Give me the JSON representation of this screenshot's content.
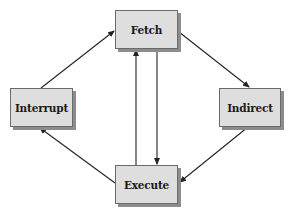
{
  "diagram": {
    "type": "state-cycle",
    "nodes": [
      {
        "id": "fetch",
        "label": "Fetch",
        "x": 115,
        "y": 10,
        "w": 63,
        "h": 39
      },
      {
        "id": "interrupt",
        "label": "Interrupt",
        "x": 10,
        "y": 88,
        "w": 63,
        "h": 39
      },
      {
        "id": "indirect",
        "label": "Indirect",
        "x": 219,
        "y": 88,
        "w": 62,
        "h": 39
      },
      {
        "id": "execute",
        "label": "Execute",
        "x": 115,
        "y": 165,
        "w": 63,
        "h": 39
      }
    ],
    "edges": [
      {
        "from": "interrupt",
        "to": "fetch",
        "x1": 41,
        "y1": 88,
        "x2": 114,
        "y2": 31
      },
      {
        "from": "fetch",
        "to": "indirect",
        "x1": 179,
        "y1": 32,
        "x2": 249,
        "y2": 87
      },
      {
        "from": "indirect",
        "to": "execute",
        "x1": 248,
        "y1": 127,
        "x2": 180,
        "y2": 182
      },
      {
        "from": "execute",
        "to": "interrupt",
        "x1": 115,
        "y1": 183,
        "x2": 40,
        "y2": 128
      },
      {
        "from": "execute",
        "to": "fetch",
        "x1": 136,
        "y1": 165,
        "x2": 136,
        "y2": 50
      },
      {
        "from": "fetch",
        "to": "execute",
        "x1": 157,
        "y1": 50,
        "x2": 157,
        "y2": 164
      }
    ]
  },
  "colors": {
    "box_fill": "#dedede",
    "box_border": "#6a6a6a",
    "box_shadow": "#8c8c8c",
    "edge": "#222222",
    "background": "#ffffff"
  }
}
